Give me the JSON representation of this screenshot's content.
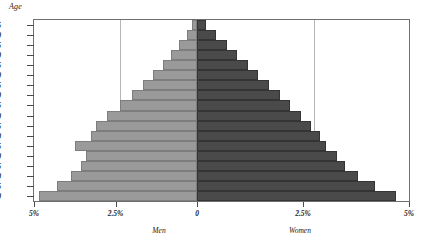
{
  "chart_data": {
    "type": "bar",
    "subtype": "population-pyramid",
    "title": "",
    "xlabel": "",
    "ylabel": "Age",
    "axis_title": "Age",
    "grid": true,
    "legend_position": "below-axis",
    "orientation": "horizontal-diverging",
    "categories": [
      "0",
      "5",
      "10",
      "15",
      "20",
      "25",
      "30",
      "35",
      "40",
      "45",
      "50",
      "55",
      "60",
      "65",
      "70",
      "75",
      "80",
      "85"
    ],
    "y_tick_labels": [
      "0",
      "5",
      "10",
      "15",
      "20",
      "25",
      "30",
      "35",
      "40",
      "45",
      "50",
      "55",
      "60",
      "65",
      "70",
      "75",
      "80",
      "85"
    ],
    "x_tick_labels": [
      "5%",
      "2.5%",
      "0",
      "2.5%",
      "5%"
    ],
    "x_tick_values": [
      -5,
      -2.5,
      0,
      2.5,
      5
    ],
    "xlim": [
      -5,
      5
    ],
    "unit": "%",
    "series": [
      {
        "name": "Men",
        "color": "#9a9a9a",
        "side": "left",
        "values": [
          4.85,
          4.3,
          3.85,
          3.55,
          3.4,
          3.75,
          3.25,
          3.1,
          2.75,
          2.35,
          2.0,
          1.65,
          1.35,
          1.05,
          0.8,
          0.55,
          0.32,
          0.14
        ]
      },
      {
        "name": "Women",
        "color": "#4a4a4a",
        "side": "right",
        "values": [
          4.7,
          4.2,
          3.8,
          3.5,
          3.3,
          3.05,
          2.9,
          2.7,
          2.45,
          2.2,
          1.95,
          1.7,
          1.45,
          1.2,
          0.95,
          0.7,
          0.45,
          0.22
        ]
      }
    ]
  },
  "axis": {
    "age_title": "Age"
  },
  "captions": {
    "men": "Men",
    "women": "Women"
  }
}
